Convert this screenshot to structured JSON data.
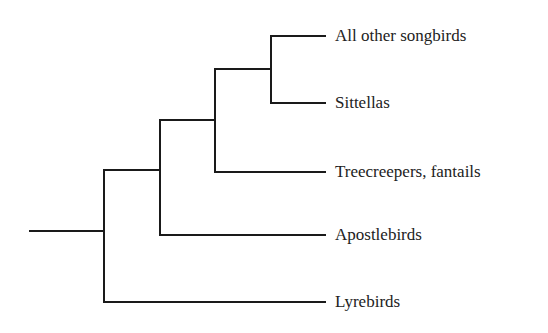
{
  "diagram": {
    "type": "phylogenetic-tree",
    "orientation": "left-to-right",
    "line_color": "#1a1a1a",
    "text_color": "#222222",
    "leaves": [
      {
        "label": "All other songbirds",
        "y": 36
      },
      {
        "label": "Sittellas",
        "y": 103
      },
      {
        "label": "Treecreepers, fantails",
        "y": 172
      },
      {
        "label": "Apostlebirds",
        "y": 235
      },
      {
        "label": "Lyrebirds",
        "y": 302
      }
    ],
    "label_x": 335,
    "leaf_line_end_x": 325,
    "root": {
      "x1": 30,
      "x2": 104,
      "y": 231
    },
    "nodes": [
      {
        "name": "node-root",
        "x": 104,
        "y_top": 170,
        "y_bottom": 302,
        "children": [
          "node-apostle",
          "Lyrebirds"
        ]
      },
      {
        "name": "node-apostle",
        "x": 160,
        "y_top": 120,
        "y_bottom": 235,
        "children": [
          "node-treecreeper",
          "Apostlebirds"
        ]
      },
      {
        "name": "node-treecreeper",
        "x": 215,
        "y_top": 69,
        "y_bottom": 172,
        "children": [
          "node-sittella",
          "Treecreepers, fantails"
        ]
      },
      {
        "name": "node-sittella",
        "x": 271,
        "y_top": 36,
        "y_bottom": 103,
        "children": [
          "All other songbirds",
          "Sittellas"
        ]
      }
    ]
  }
}
